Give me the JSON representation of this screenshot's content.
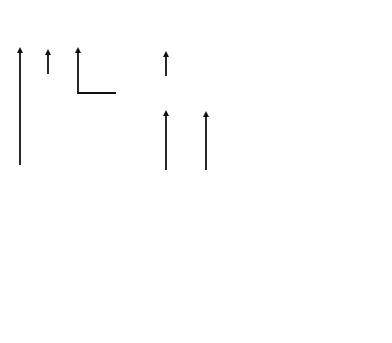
{
  "diagram": {
    "nodes": {
      "chinese_military": {
        "line1": "Chinese Military-",
        "line2": "Industrial Complex"
      },
      "ngos_politicians_left": {
        "line1": "NGOs &",
        "line2": "Politicians"
      },
      "us_ai_platforms": {
        "line1": "US AI & Digital Platforms",
        "line2": "(Google, Facebook, Twitter,",
        "line3": "Amazon, Netflix, Etc.)"
      },
      "us_intelligence": {
        "line1": "US Intelligence"
      },
      "india_intermediaries": {
        "line1": "India-based Intermediaries",
        "line2": "(Jio, Amazon India, Flipkart,",
        "line3": "Indian Telecoms, Etc.)"
      },
      "academics": {
        "line1": "Academics,",
        "line2": "Think Tanks,",
        "line3": "Foundations,",
        "line4": "Agencies"
      },
      "church_politicians": {
        "line1": "Church &",
        "line2": "Politicians"
      },
      "ngos_right": {
        "line1": "NGOs"
      },
      "joshua_project": {
        "line1": "Joshua",
        "line2": "Project"
      }
    },
    "left_group": {
      "items": [
        {
          "line1": "Aadhaar"
        },
        {
          "line1": "Retail Consumer",
          "line2": "Transactions"
        },
        {
          "line1": "5G Surveillance"
        },
        {
          "line1": "Business To",
          "line2": "Business",
          "line3": "Transactions"
        },
        {
          "line1": "Medical Data"
        },
        {
          "line1": "Payment Systems"
        }
      ]
    },
    "right_group": {
      "items": [
        {
          "line1": "Facebook",
          "line2": "WhatsApp",
          "line3": "Instagram"
        },
        {
          "line1": "Twitter"
        },
        {
          "line1": "Smart Phone",
          "line2": "Facial",
          "line3": "Recognition"
        },
        {
          "line1": "GPS Data"
        },
        {
          "line1": "Email"
        },
        {
          "line1": "Video Conf",
          "line2": "Platforms"
        },
        {
          "line1": "YouTube",
          "line2": "Google Search"
        }
      ]
    },
    "colors": {
      "arrow": "#111111",
      "box_border": "#7a7a7a",
      "text": "#2d2d2d"
    }
  }
}
